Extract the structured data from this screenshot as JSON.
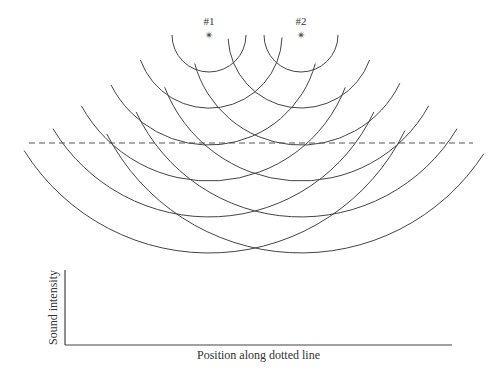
{
  "diagram": {
    "sources": [
      {
        "label": "#1",
        "x": 209,
        "y": 35
      },
      {
        "label": "#2",
        "x": 301,
        "y": 35
      }
    ],
    "radii": [
      37,
      73,
      110,
      146,
      182,
      218
    ],
    "source_angles_deg": [
      {
        "left": [
          0,
          20,
          27,
          29,
          31,
          32
        ],
        "right": [
          0,
          2,
          15,
          21,
          25,
          26
        ]
      },
      {
        "left": [
          0,
          3,
          15,
          21,
          25,
          27
        ],
        "right": [
          0,
          20,
          26,
          29,
          31,
          33
        ]
      }
    ],
    "dotted_line": {
      "x1": 29,
      "x2": 473,
      "y": 143
    },
    "wave_color": "#444444"
  },
  "graph": {
    "y_axis_label": "Sound intensity",
    "x_axis_label": "Position along dotted line",
    "origin": {
      "x": 65,
      "y": 345
    },
    "x_end": 452,
    "y_top": 270
  }
}
